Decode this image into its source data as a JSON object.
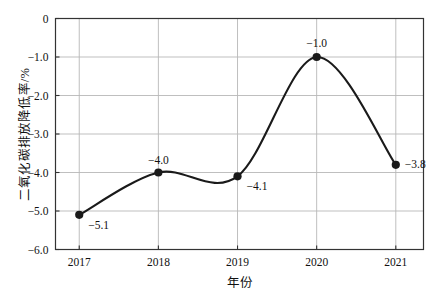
{
  "chart_data": {
    "type": "line",
    "title": "",
    "subtitle": "",
    "xlabel": "年份",
    "ylabel": "二氧化碳排放降低率/%",
    "categories": [
      "2017",
      "2018",
      "2019",
      "2020",
      "2021"
    ],
    "x": [
      2017,
      2018,
      2019,
      2020,
      2021
    ],
    "series": [
      {
        "name": "二氧化碳排放降低率",
        "values": [
          -5.1,
          -4.0,
          -4.1,
          -1.0,
          -3.8
        ],
        "point_labels": [
          "−5.1",
          "−4.0",
          "−4.1",
          "−1.0",
          "−3.8"
        ],
        "line_color": "#1a1a1a",
        "marker_color": "#1a1a1a",
        "marker": "circle",
        "smooth": true
      }
    ],
    "xlim": [
      2016.7,
      2021.35
    ],
    "ylim": [
      -6.0,
      0.0
    ],
    "yticks": [
      0,
      -1.0,
      -2.0,
      -3.0,
      -4.0,
      -5.0,
      -6.0
    ],
    "ytick_labels": [
      "0",
      "−1.0",
      "−2.0",
      "−3.0",
      "−4.0",
      "−5.0",
      "−6.0"
    ],
    "xticks": [
      2017,
      2018,
      2019,
      2020,
      2021
    ],
    "xtick_labels": [
      "2017",
      "2018",
      "2019",
      "2020",
      "2021"
    ],
    "grid": {
      "horizontal": true,
      "vertical": true,
      "color": "#b8b8b8"
    },
    "legend": {
      "visible": false,
      "position": "none"
    },
    "frame_color": "#333333",
    "background_color": "#ffffff"
  },
  "colors": {
    "line": "#1a1a1a",
    "grid": "#b8b8b8",
    "frame": "#333333",
    "text": "#111111",
    "background": "#ffffff"
  }
}
